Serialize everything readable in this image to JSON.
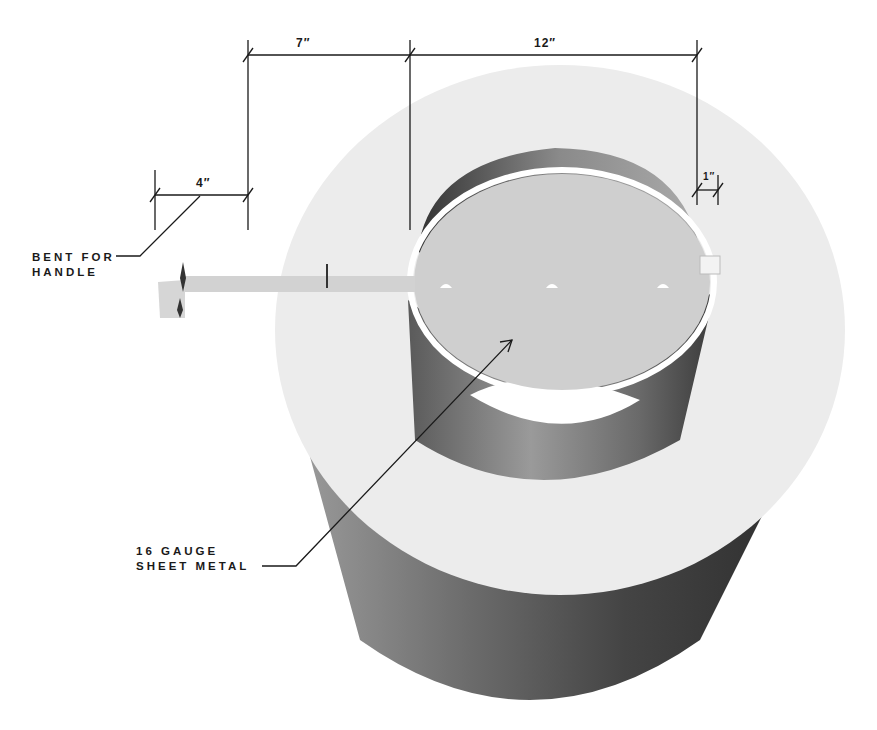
{
  "dimensions": {
    "handle_bend": "4″",
    "handle_length": "7″",
    "disc_diameter": "12″",
    "tab": "1″"
  },
  "callouts": {
    "handle": {
      "line1": "BENT FOR",
      "line2": "HANDLE"
    },
    "material": {
      "line1": "16 GAUGE",
      "line2": "SHEET METAL"
    }
  },
  "colors": {
    "outer_top": "#ececec",
    "disc_top": "#cfcfcf",
    "wall_dark": "#4a4a4a",
    "wall_mid": "#8a8a8a",
    "line": "#1a1a1a"
  }
}
